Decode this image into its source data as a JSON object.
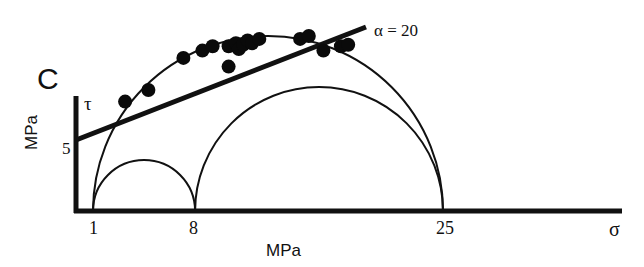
{
  "panel_label": "C",
  "chart_data": {
    "type": "scatter",
    "title": "",
    "panel": "C",
    "xlabel": "MPa",
    "ylabel": "MPa",
    "x_axis_symbol": "σ",
    "y_axis_symbol": "τ",
    "x_ticks": [
      {
        "value": 1,
        "label": "1"
      },
      {
        "value": 8,
        "label": "8"
      },
      {
        "value": 25,
        "label": "25"
      }
    ],
    "y_ticks": [
      {
        "value": 5,
        "label": "5"
      }
    ],
    "grid": false,
    "mohr_circles": [
      {
        "sigma_min": 1,
        "sigma_max": 25
      },
      {
        "sigma_min": 1,
        "sigma_max": 8
      },
      {
        "sigma_min": 8,
        "sigma_max": 25
      }
    ],
    "failure_envelope": {
      "label": "α = 20",
      "intercept_tau": 5,
      "angle_deg": 20
    },
    "points": [
      {
        "sigma": 3.2,
        "tau": 7.5
      },
      {
        "sigma": 4.8,
        "tau": 8.3
      },
      {
        "sigma": 7.2,
        "tau": 10.5
      },
      {
        "sigma": 8.5,
        "tau": 11.0
      },
      {
        "sigma": 9.2,
        "tau": 11.3
      },
      {
        "sigma": 10.3,
        "tau": 11.3
      },
      {
        "sigma": 10.8,
        "tau": 11.5
      },
      {
        "sigma": 11.0,
        "tau": 11.1
      },
      {
        "sigma": 11.3,
        "tau": 11.4
      },
      {
        "sigma": 11.6,
        "tau": 11.7
      },
      {
        "sigma": 11.9,
        "tau": 11.5
      },
      {
        "sigma": 12.4,
        "tau": 11.8
      },
      {
        "sigma": 10.3,
        "tau": 9.9
      },
      {
        "sigma": 15.2,
        "tau": 11.8
      },
      {
        "sigma": 15.8,
        "tau": 12.0
      },
      {
        "sigma": 16.8,
        "tau": 11.0
      },
      {
        "sigma": 18.0,
        "tau": 11.3
      },
      {
        "sigma": 18.5,
        "tau": 11.4
      }
    ]
  }
}
